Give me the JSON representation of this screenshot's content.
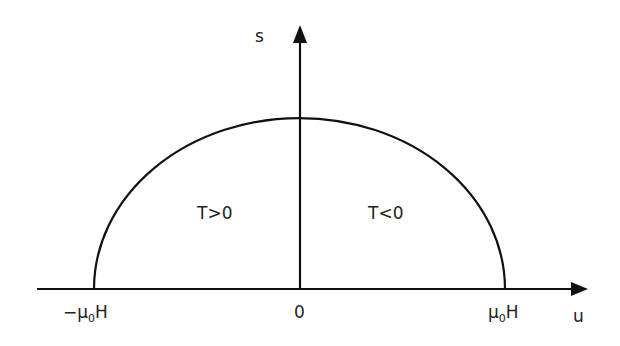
{
  "diagram": {
    "axes": {
      "x_label": "u",
      "y_label": "s",
      "origin_label": "0",
      "left_tick": {
        "prefix": "−μ",
        "sub": "0",
        "suffix": "H"
      },
      "right_tick": {
        "prefix": "μ",
        "sub": "0",
        "suffix": "H"
      }
    },
    "regions": {
      "left": "T>0",
      "right": "T<0"
    },
    "curve": "semi-ellipse from −μ0H to μ0H",
    "colors": {
      "line": "#111111",
      "text": "#222222",
      "background": "#ffffff"
    }
  }
}
